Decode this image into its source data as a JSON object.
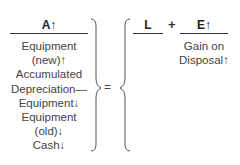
{
  "assets": {
    "header": "A↑",
    "items": [
      "Equipment",
      "(new)↑",
      "Accumulated",
      "Depreciation—",
      "Equipment↓",
      "Equipment",
      "(old)↓",
      "Cash↓"
    ]
  },
  "equals_sign": "=",
  "liabilities": {
    "header": "L"
  },
  "plus_sign": "+",
  "equity": {
    "header": "E↑",
    "items": [
      "Gain on",
      "Disposal↑"
    ]
  }
}
